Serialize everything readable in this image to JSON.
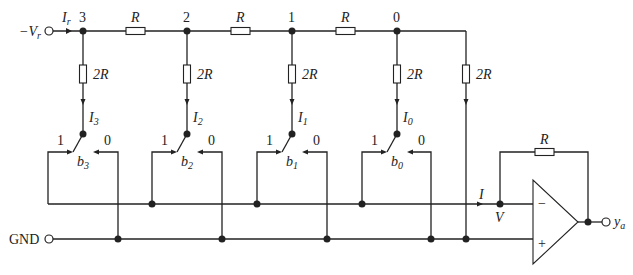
{
  "diagram": {
    "input_terminal": {
      "label": "−V",
      "subscript": "r"
    },
    "input_current": {
      "label": "I",
      "subscript": "r"
    },
    "nodes": [
      {
        "id": "3",
        "current": "I",
        "current_sub": "3",
        "switch": "b",
        "switch_sub": "3"
      },
      {
        "id": "2",
        "current": "I",
        "current_sub": "2",
        "switch": "b",
        "switch_sub": "2"
      },
      {
        "id": "1",
        "current": "I",
        "current_sub": "1",
        "switch": "b",
        "switch_sub": "1"
      },
      {
        "id": "0",
        "current": "I",
        "current_sub": "0",
        "switch": "b",
        "switch_sub": "0"
      }
    ],
    "series_resistor_label": "R",
    "shunt_resistor_label": "2R",
    "switch_pos_1": "1",
    "switch_pos_0": "0",
    "ground_label": "GND",
    "sum_current": "I",
    "inverting_node": "V",
    "feedback_resistor": "R",
    "opamp_minus": "−",
    "opamp_plus": "+",
    "output": {
      "label": "y",
      "subscript": "a"
    }
  }
}
